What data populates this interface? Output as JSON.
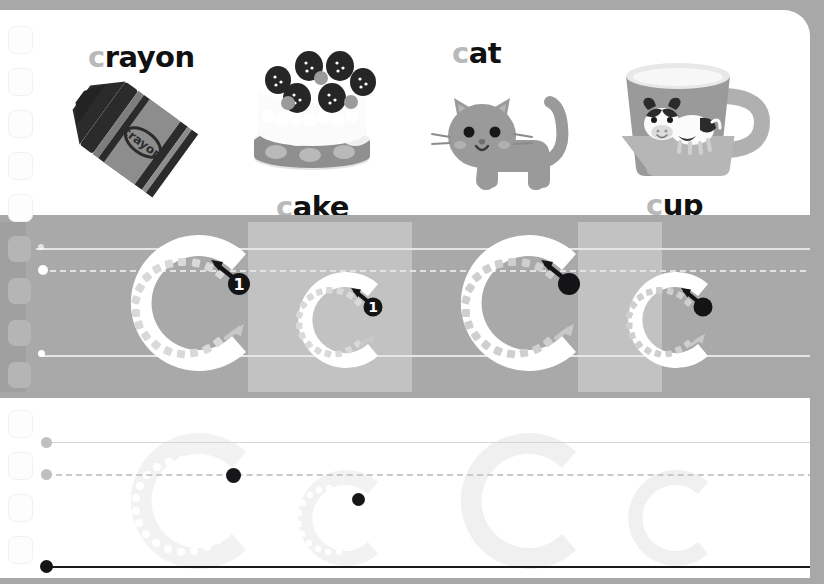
{
  "worksheet": {
    "letter": "C",
    "letter_lower": "c",
    "title": "Letter C tracing worksheet",
    "stroke_number": "1"
  },
  "vocabulary": [
    {
      "id": "crayon",
      "lead": "c",
      "rest": "rayon",
      "full": "crayon",
      "illustration": "crayon-illustration"
    },
    {
      "id": "cake",
      "lead": "c",
      "rest": "ake",
      "full": "cake",
      "illustration": "cake-illustration"
    },
    {
      "id": "cat",
      "lead": "c",
      "rest": "at",
      "full": "cat",
      "illustration": "cat-illustration"
    },
    {
      "id": "cup",
      "lead": "c",
      "rest": "up",
      "full": "cup",
      "illustration": "cup-illustration"
    }
  ],
  "trace_row": {
    "background": "#a9a9a9",
    "band_light": "#c2c2c2",
    "letters": [
      {
        "id": "trace-1",
        "glyph": "C",
        "case": "upper",
        "size": "large",
        "marker": "numbered",
        "number": "1"
      },
      {
        "id": "trace-2",
        "glyph": "c",
        "case": "lower",
        "size": "small",
        "marker": "numbered",
        "number": "1"
      },
      {
        "id": "trace-3",
        "glyph": "C",
        "case": "upper",
        "size": "large",
        "marker": "dot",
        "number": ""
      },
      {
        "id": "trace-4",
        "glyph": "c",
        "case": "lower",
        "size": "small",
        "marker": "dot",
        "number": ""
      }
    ],
    "guides": {
      "top_line": "solid",
      "mid_line": "dashed",
      "base_line": "solid"
    }
  },
  "practice_row": {
    "background": "#ffffff",
    "letters": [
      {
        "id": "practice-1",
        "glyph": "C",
        "case": "upper",
        "size": "large",
        "marker": "dot"
      },
      {
        "id": "practice-2",
        "glyph": "c",
        "case": "lower",
        "size": "small",
        "marker": "dot"
      },
      {
        "id": "practice-3",
        "glyph": "C",
        "case": "upper",
        "size": "large",
        "marker": "none"
      },
      {
        "id": "practice-4",
        "glyph": "c",
        "case": "lower",
        "size": "small",
        "marker": "none"
      }
    ],
    "guides": {
      "top_line": "solid-light",
      "mid_line": "dashed",
      "base_line": "solid-dark"
    }
  },
  "colors": {
    "page_background": "#a8a8a8",
    "card": "#ffffff",
    "band": "#a9a9a9",
    "band_light": "#c2c2c2",
    "text": "#111111",
    "lead_letter": "#b9b9b9",
    "guide_light": "#e6e6e6",
    "guide_dark": "#1a1a1a",
    "ghost_letter": "#f2f2f2",
    "marker": "#141414"
  }
}
